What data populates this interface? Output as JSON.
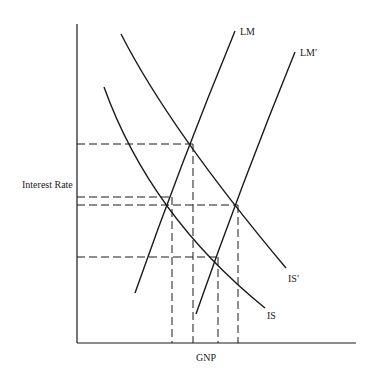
{
  "diagram": {
    "type": "IS-LM",
    "colors": {
      "line": "#1a1a1a",
      "background": "#ffffff"
    },
    "axes": {
      "ylabel": "Interest Rate",
      "xlabel": "GNP"
    },
    "curves": [
      {
        "id": "LM",
        "label": "LM"
      },
      {
        "id": "LM_prime",
        "label": "LM′"
      },
      {
        "id": "IS",
        "label": "IS"
      },
      {
        "id": "IS_prime",
        "label": "IS′"
      }
    ],
    "equilibria": [
      {
        "curves": [
          "IS_prime",
          "LM"
        ],
        "note": "highest interest rate"
      },
      {
        "curves": [
          "IS",
          "LM"
        ]
      },
      {
        "curves": [
          "IS_prime",
          "LM_prime"
        ]
      },
      {
        "curves": [
          "IS",
          "LM_prime"
        ],
        "note": "lowest interest rate"
      }
    ]
  }
}
